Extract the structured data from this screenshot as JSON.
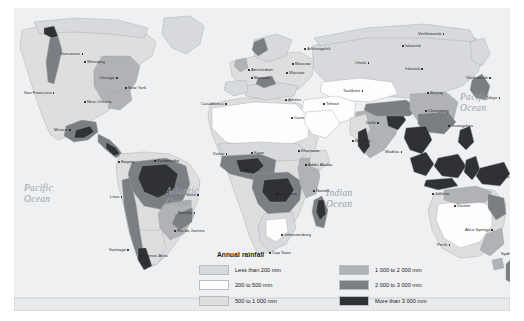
{
  "map": {
    "title": "World annual rainfall map",
    "background_color": "#f2f3f5",
    "ocean_color": "#eef0f2",
    "ocean_labels": [
      {
        "name": "pacific-ocean-left",
        "line1": "Pacific",
        "line2": "Ocean",
        "x": 10,
        "y": 175
      },
      {
        "name": "atlantic-ocean",
        "line1": "Atlantic",
        "line2": "Ocean",
        "x": 152,
        "y": 178
      },
      {
        "name": "indian-ocean",
        "line1": "Indian",
        "line2": "Ocean",
        "x": 312,
        "y": 180
      },
      {
        "name": "pacific-ocean-right",
        "line1": "Pacific",
        "line2": "Ocean",
        "x": 446,
        "y": 84
      }
    ],
    "cities": [
      {
        "label": "Vancouver",
        "x": 46,
        "y": 44,
        "side": "right"
      },
      {
        "label": "San Francisco",
        "x": 10,
        "y": 83,
        "side": "right"
      },
      {
        "label": "Winnipeg",
        "x": 70,
        "y": 52,
        "side": "left"
      },
      {
        "label": "Chicago",
        "x": 85,
        "y": 68,
        "side": "right"
      },
      {
        "label": "New York",
        "x": 111,
        "y": 78,
        "side": "left"
      },
      {
        "label": "New Orleans",
        "x": 70,
        "y": 92,
        "side": "left"
      },
      {
        "label": "Mexico",
        "x": 40,
        "y": 120,
        "side": "right"
      },
      {
        "label": "Bogota",
        "x": 104,
        "y": 152,
        "side": "left"
      },
      {
        "label": "Paramaribo",
        "x": 140,
        "y": 151,
        "side": "left"
      },
      {
        "label": "Lima",
        "x": 96,
        "y": 187,
        "side": "right"
      },
      {
        "label": "Natal",
        "x": 172,
        "y": 185,
        "side": "right"
      },
      {
        "label": "Brasilia",
        "x": 164,
        "y": 203,
        "side": "right"
      },
      {
        "label": "Rio de Janeiro",
        "x": 160,
        "y": 221,
        "side": "left"
      },
      {
        "label": "Santiago",
        "x": 95,
        "y": 240,
        "side": "right"
      },
      {
        "label": "Buenos Aires",
        "x": 126,
        "y": 246,
        "side": "left"
      },
      {
        "label": "Casablanca",
        "x": 187,
        "y": 94,
        "side": "right"
      },
      {
        "label": "Dakar",
        "x": 199,
        "y": 144,
        "side": "right"
      },
      {
        "label": "Kano",
        "x": 237,
        "y": 143,
        "side": "left"
      },
      {
        "label": "Lagos",
        "x": 231,
        "y": 160,
        "side": "left"
      },
      {
        "label": "Amsterdam",
        "x": 234,
        "y": 60,
        "side": "left"
      },
      {
        "label": "Brussels",
        "x": 237,
        "y": 68,
        "side": "left"
      },
      {
        "label": "Moscow",
        "x": 278,
        "y": 54,
        "side": "left"
      },
      {
        "label": "Warsaw",
        "x": 272,
        "y": 63,
        "side": "left"
      },
      {
        "label": "Arkhangelsk",
        "x": 290,
        "y": 39,
        "side": "left"
      },
      {
        "label": "Athens",
        "x": 271,
        "y": 90,
        "side": "left"
      },
      {
        "label": "Cairo",
        "x": 277,
        "y": 108,
        "side": "left"
      },
      {
        "label": "Tehran",
        "x": 309,
        "y": 94,
        "side": "left"
      },
      {
        "label": "Khartoum",
        "x": 284,
        "y": 141,
        "side": "left"
      },
      {
        "label": "Addis Ababa",
        "x": 291,
        "y": 155,
        "side": "left"
      },
      {
        "label": "Kinshasa",
        "x": 262,
        "y": 184,
        "side": "left"
      },
      {
        "label": "Nairobi",
        "x": 299,
        "y": 181,
        "side": "left"
      },
      {
        "label": "Johannesburg",
        "x": 267,
        "y": 225,
        "side": "left"
      },
      {
        "label": "Cap Town",
        "x": 255,
        "y": 243,
        "side": "left"
      },
      {
        "label": "Tashkent",
        "x": 329,
        "y": 81,
        "side": "right"
      },
      {
        "label": "Omsk",
        "x": 341,
        "y": 53,
        "side": "right"
      },
      {
        "label": "Irkoutsk",
        "x": 391,
        "y": 59,
        "side": "right"
      },
      {
        "label": "Iakoutsk",
        "x": 388,
        "y": 36,
        "side": "left"
      },
      {
        "label": "Verkhoiansk",
        "x": 404,
        "y": 24,
        "side": "right"
      },
      {
        "label": "Vladivostok",
        "x": 452,
        "y": 68,
        "side": "right"
      },
      {
        "label": "Tokyo",
        "x": 472,
        "y": 88,
        "side": "right"
      },
      {
        "label": "Beijing",
        "x": 413,
        "y": 83,
        "side": "left"
      },
      {
        "label": "Chongqing",
        "x": 411,
        "y": 101,
        "side": "left"
      },
      {
        "label": "Guangzhou",
        "x": 434,
        "y": 116,
        "side": "left"
      },
      {
        "label": "Delhi",
        "x": 352,
        "y": 113,
        "side": "right"
      },
      {
        "label": "Bombay",
        "x": 338,
        "y": 131,
        "side": "left"
      },
      {
        "label": "Madras",
        "x": 371,
        "y": 142,
        "side": "right"
      },
      {
        "label": "Jakarta",
        "x": 418,
        "y": 184,
        "side": "left"
      },
      {
        "label": "Jayapura",
        "x": 478,
        "y": 167,
        "side": "right"
      },
      {
        "label": "Darwin",
        "x": 440,
        "y": 196,
        "side": "left"
      },
      {
        "label": "Alice Springs",
        "x": 451,
        "y": 220,
        "side": "right"
      },
      {
        "label": "Perth",
        "x": 423,
        "y": 235,
        "side": "right"
      },
      {
        "label": "Sydney",
        "x": 487,
        "y": 244,
        "side": "right"
      }
    ]
  },
  "legend": {
    "title": "Annual rainfall",
    "left_column": [
      {
        "label": "Less than 200 mm",
        "color": "#d7d9dc"
      },
      {
        "label": "200 to 500 mm",
        "color": "#fdfdfd"
      },
      {
        "label": "500 to 1 000 mm",
        "color": "#dededf"
      },
      {
        "label": "1 000 to 2 000 mm",
        "color": "#b0b2b5"
      }
    ],
    "right_column": [
      {
        "label": "1 000 to 2 000 mm",
        "color": "#b0b2b5"
      },
      {
        "label": "2 000 to 3 000 mm",
        "color": "#7b7e82"
      },
      {
        "label": "More than 3 000 mm",
        "color": "#2f3135"
      }
    ],
    "rows_left": [
      {
        "label": "Less than 200 mm",
        "color": "#d7d9dc"
      },
      {
        "label": "200 to 500 mm",
        "color": "#fdfdfd"
      },
      {
        "label": "500 to 1 000 mm",
        "color": "#dededf"
      }
    ]
  },
  "chart_data": {
    "type": "map",
    "title": "Annual rainfall",
    "legend_title": "Annual rainfall",
    "classes": [
      {
        "label": "Less than 200 mm",
        "min_mm": 0,
        "max_mm": 200,
        "color": "#d7d9dc"
      },
      {
        "label": "200 to 500 mm",
        "min_mm": 200,
        "max_mm": 500,
        "color": "#fdfdfd"
      },
      {
        "label": "500 to 1 000 mm",
        "min_mm": 500,
        "max_mm": 1000,
        "color": "#dededf"
      },
      {
        "label": "1 000 to 2 000 mm",
        "min_mm": 1000,
        "max_mm": 2000,
        "color": "#b0b2b5"
      },
      {
        "label": "2 000 to 3 000 mm",
        "min_mm": 2000,
        "max_mm": 3000,
        "color": "#7b7e82"
      },
      {
        "label": "More than 3 000 mm",
        "min_mm": 3000,
        "max_mm": null,
        "color": "#2f3135"
      }
    ],
    "legend_position": "bottom-center",
    "projection": "world-equirectangular-like",
    "oceans_labeled": [
      "Pacific Ocean",
      "Atlantic Ocean",
      "Indian Ocean",
      "Pacific Ocean"
    ]
  }
}
